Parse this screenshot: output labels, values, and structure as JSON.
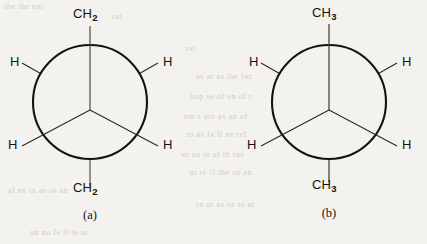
{
  "page": {
    "background_color": "#f4f2ee",
    "ink_color": "#15130e",
    "bleed_through_lines": [
      "the  the  ent",
      "rot",
      "rat",
      "as ar as the fac",
      "hop se of en ol r",
      "am s are as an of",
      "ro as fa ll ne rel",
      "er an st of th ras",
      "at re if the so an",
      "al an in as ot an",
      "rn ot as ea to at",
      "un no le ll te ar"
    ]
  },
  "figure": {
    "type": "newman-projections",
    "diagrams": [
      {
        "id": "a",
        "caption": "(a)",
        "circle": {
          "cx": 90,
          "cy": 102,
          "r": 57
        },
        "front_carbon_vertex": {
          "x": 90,
          "y": 110
        },
        "top_label": {
          "text": "CH",
          "subscript": "2"
        },
        "bottom_label": {
          "text": "CH",
          "subscript": "2"
        },
        "hydrogen_labels": [
          "H",
          "H",
          "H",
          "H"
        ],
        "bonds": [
          {
            "name": "front-bond-up",
            "carbon": "front",
            "angle_deg": 90,
            "label": "CH2"
          },
          {
            "name": "front-bond-lower-left",
            "carbon": "front",
            "angle_deg": 210,
            "label": "H"
          },
          {
            "name": "front-bond-lower-right",
            "carbon": "front",
            "angle_deg": 330,
            "label": "H"
          },
          {
            "name": "back-bond-upper-left",
            "carbon": "back",
            "angle_deg": 150,
            "label": "H"
          },
          {
            "name": "back-bond-upper-right",
            "carbon": "back",
            "angle_deg": 30,
            "label": "H"
          },
          {
            "name": "back-bond-down",
            "carbon": "back",
            "angle_deg": 270,
            "label": "CH2"
          }
        ]
      },
      {
        "id": "b",
        "caption": "(b)",
        "circle": {
          "cx": 329,
          "cy": 102,
          "r": 57
        },
        "front_carbon_vertex": {
          "x": 329,
          "y": 110
        },
        "top_label": {
          "text": "CH",
          "subscript": "3"
        },
        "bottom_label": {
          "text": "CH",
          "subscript": "3"
        },
        "hydrogen_labels": [
          "H",
          "H",
          "H",
          "H"
        ],
        "bonds": [
          {
            "name": "front-bond-up",
            "carbon": "front",
            "angle_deg": 90,
            "label": "CH3"
          },
          {
            "name": "front-bond-lower-left",
            "carbon": "front",
            "angle_deg": 210,
            "label": "H"
          },
          {
            "name": "front-bond-lower-right",
            "carbon": "front",
            "angle_deg": 330,
            "label": "H"
          },
          {
            "name": "back-bond-upper-left",
            "carbon": "back",
            "angle_deg": 150,
            "label": "H"
          },
          {
            "name": "back-bond-upper-right",
            "carbon": "back",
            "angle_deg": 30,
            "label": "H"
          },
          {
            "name": "back-bond-down",
            "carbon": "back",
            "angle_deg": 270,
            "label": "CH3"
          }
        ]
      }
    ]
  }
}
